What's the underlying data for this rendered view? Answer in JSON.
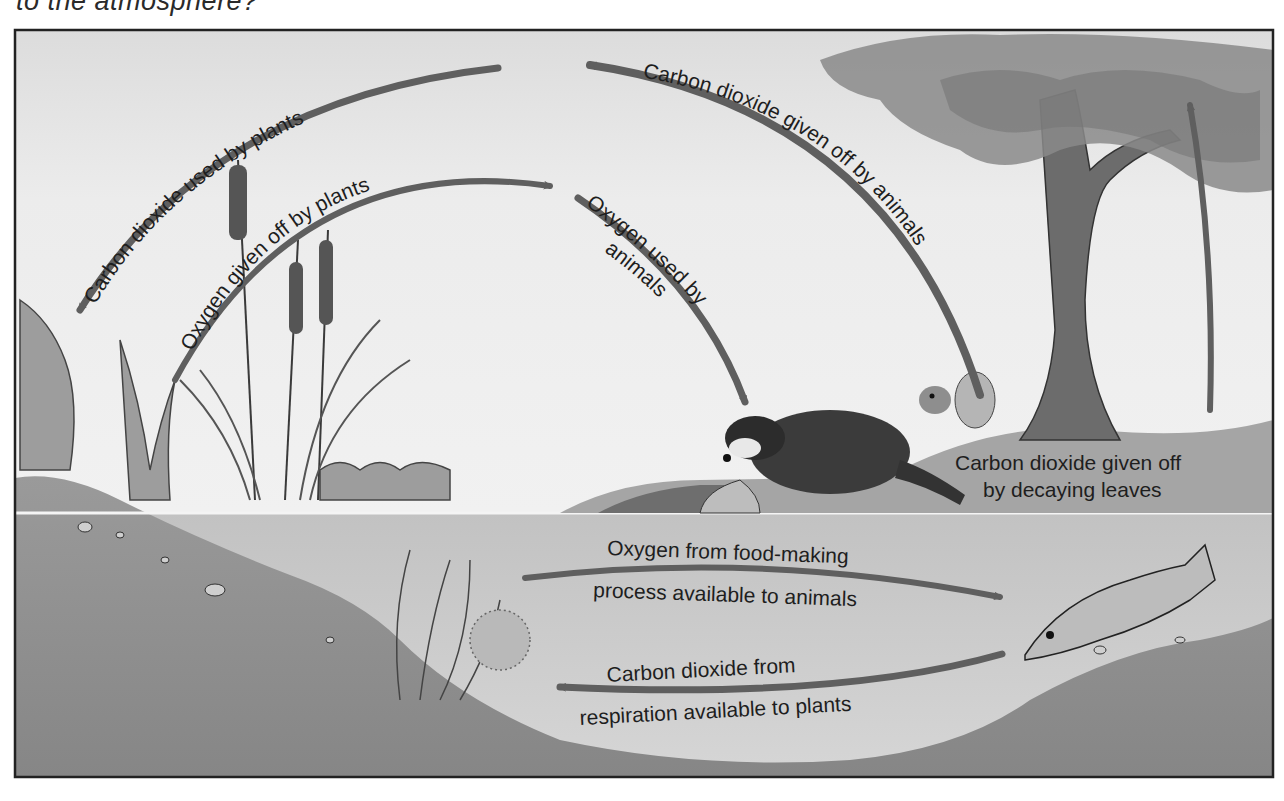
{
  "question": {
    "text": "to the atmosphere?"
  },
  "diagram": {
    "colors": {
      "sky": "#e9e9e9",
      "water": "#c9c9c9",
      "soil": "#8c8c8c",
      "arrow": "#5f5f5f",
      "frame": "#222222",
      "text": "#1e1e1e"
    },
    "labels": {
      "co2_used_by_plants": "Carbon dioxide used by plants",
      "o2_given_off_by_plants": "Oxygen given off by plants",
      "co2_given_off_by_animals": "Carbon dioxide given off by animals",
      "o2_used_by_animals_line1": "Oxygen used by",
      "o2_used_by_animals_line2": "animals",
      "co2_decaying_leaves_line1": "Carbon dioxide given off",
      "co2_decaying_leaves_line2": "by decaying leaves",
      "o2_food_making_line1": "Oxygen from food-making",
      "o2_food_making_line2": "process available to animals",
      "co2_respiration_line1": "Carbon dioxide from",
      "co2_respiration_line2": "respiration available to plants"
    },
    "elements": [
      "cattails",
      "shore plants",
      "raccoon",
      "squirrel",
      "tree",
      "fish",
      "underwater plants",
      "pond soil"
    ]
  }
}
